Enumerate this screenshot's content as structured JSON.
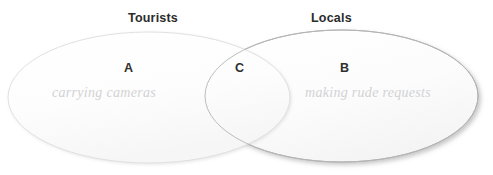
{
  "diagram": {
    "type": "venn",
    "background_color": "#ffffff",
    "sets": [
      {
        "id": "left",
        "title": "Tourists",
        "region_label": "A",
        "region_description": "carrying cameras",
        "fill_color": "#fcfcfc",
        "stroke_color": "#dcdcdc"
      },
      {
        "id": "right",
        "title": "Locals",
        "region_label": "B",
        "region_description": "making rude requests",
        "fill_color": "#fbfbfb",
        "stroke_color": "#9a9a9a"
      }
    ],
    "intersection": {
      "region_label": "C",
      "region_description": ""
    },
    "text_colors": {
      "title": "#2b2b2b",
      "region_letter": "#2f2f2f",
      "region_description": "#d2d2d4"
    }
  }
}
